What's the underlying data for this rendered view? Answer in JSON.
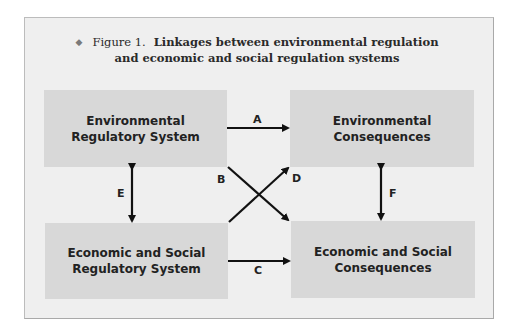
{
  "figure": {
    "bullet_icon": "diamond-bullet",
    "number": "Figure 1.",
    "title_line1": "Linkages between environmental regulation",
    "title_line2": "and economic and social regulation systems"
  },
  "boxes": {
    "env_regulatory": {
      "line1": "Environmental",
      "line2": "Regulatory System"
    },
    "env_consequences": {
      "line1": "Environmental",
      "line2": "Consequences"
    },
    "econ_regulatory": {
      "line1": "Economic and Social",
      "line2": "Regulatory System"
    },
    "econ_consequences": {
      "line1": "Economic and Social",
      "line2": "Consequences"
    }
  },
  "links": {
    "A": "A",
    "B": "B",
    "C": "C",
    "D": "D",
    "E": "E",
    "F": "F"
  },
  "colors": {
    "frame_bg": "#efefef",
    "box_bg": "#d8d8d8",
    "ink": "#222222"
  }
}
